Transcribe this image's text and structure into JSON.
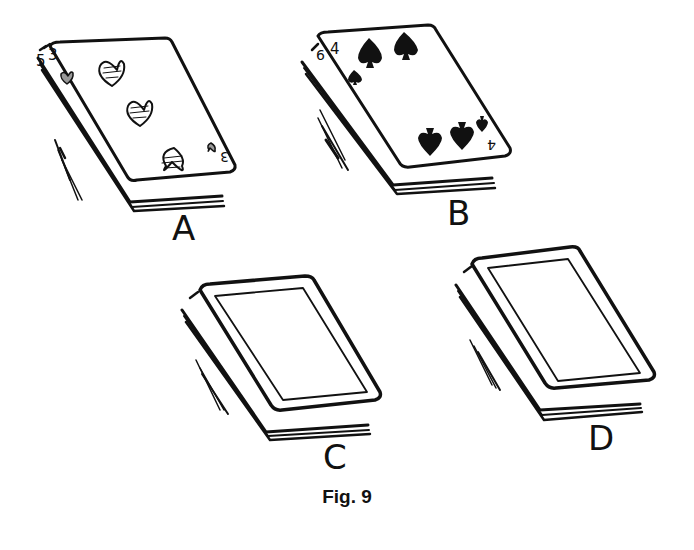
{
  "figure": {
    "caption": "Fig. 9",
    "ink_color": "#111111",
    "background": "#ffffff"
  },
  "decks": [
    {
      "label": "A",
      "top_card": "3 of hearts",
      "index_top": "3",
      "under_index": "5",
      "pips": [
        "heart",
        "heart",
        "heart"
      ],
      "face": "up"
    },
    {
      "label": "B",
      "top_card": "4 of spades",
      "index_top": "4",
      "under_index": "6",
      "pips": [
        "spade",
        "spade",
        "spade",
        "spade"
      ],
      "face": "up"
    },
    {
      "label": "C",
      "top_card": "card back",
      "face": "down"
    },
    {
      "label": "D",
      "top_card": "card back",
      "face": "down"
    }
  ]
}
